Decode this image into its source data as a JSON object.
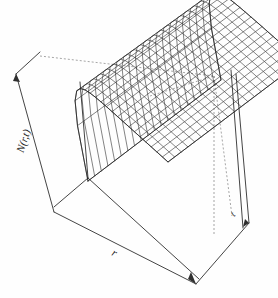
{
  "figure": {
    "kind": "3d-wireframe-surface-plot",
    "background_color": "#fefefe",
    "line_color": "#2b2b2b",
    "box_color": "#3a3a3a",
    "hidden_edge_style": "dashed"
  },
  "axes": {
    "z_label": "N(r,t)",
    "x_label": "r",
    "y_label": "t"
  },
  "chart_data": {
    "type": "surface",
    "title": "",
    "xlabel": "r",
    "ylabel": "t",
    "zlabel": "N(r,t)",
    "grid": false,
    "legend": "none",
    "projection": "persp",
    "x": [
      0,
      0.05,
      0.1,
      0.15,
      0.2,
      0.25,
      0.3,
      0.35,
      0.4,
      0.45,
      0.5,
      0.55,
      0.6,
      0.65,
      0.7,
      0.75,
      0.8,
      0.85,
      0.9,
      0.95,
      1.0
    ],
    "y": [
      0,
      0.05,
      0.1,
      0.15,
      0.2,
      0.25,
      0.3,
      0.35,
      0.4,
      0.45,
      0.5,
      0.55,
      0.6,
      0.65,
      0.7,
      0.75,
      0.8,
      0.85,
      0.9,
      0.95,
      1.0
    ],
    "xlim": [
      0,
      1
    ],
    "ylim": [
      0,
      1
    ],
    "zlim": [
      0,
      1
    ],
    "surface_description": "Monotone saturating surface: N rises steeply in r near r=0 (a near-vertical cliff at the front-left edge) then flattens to a high plateau across most of r and t; the plateau is essentially flat in t.",
    "z_model": "N(r,t) = 1 - exp(-k*r) with mild t-dependence, k approx 14",
    "mesh": {
      "nx": 21,
      "ny": 21
    }
  }
}
